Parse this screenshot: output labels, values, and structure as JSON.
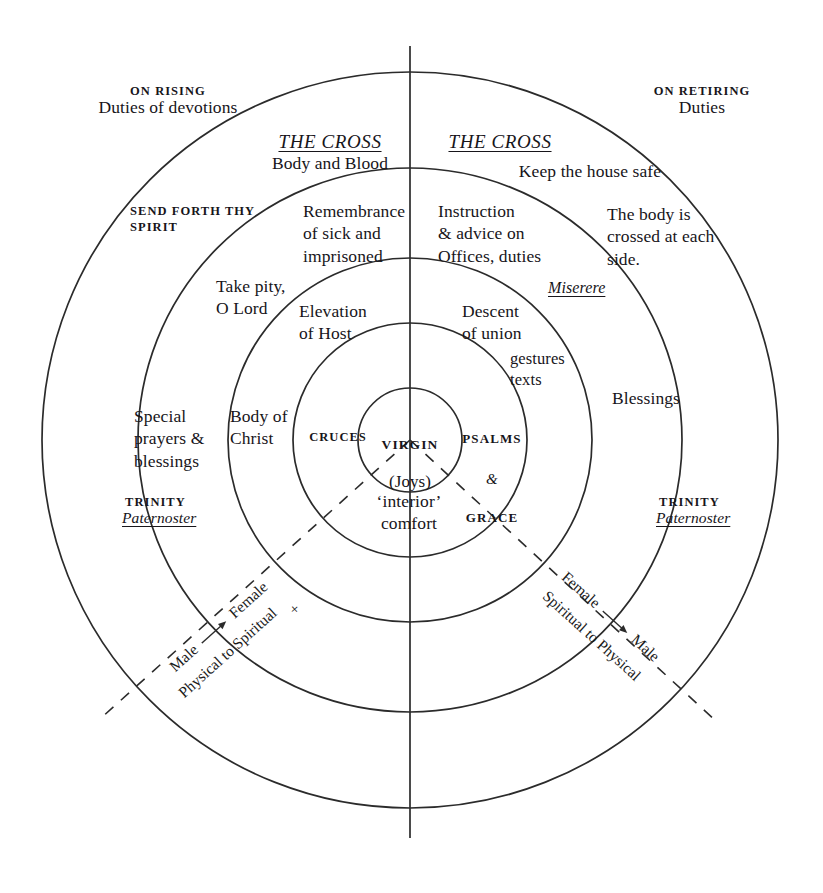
{
  "diagram": {
    "geometry": {
      "center_x": 410,
      "center_y": 440,
      "ring_radii": [
        52,
        117,
        182,
        272,
        368
      ],
      "axis_line_top": 46,
      "axis_line_bottom": 838
    },
    "colors": {
      "stroke": "#2b2b2b",
      "text": "#17151a",
      "background": "#ffffff"
    },
    "outer_labels": {
      "left_heading": "ON RISING",
      "left_sub": "Duties of devotions",
      "right_heading": "ON RETIRING",
      "right_sub": "Duties"
    },
    "cross_headings": {
      "left_title": "THE CROSS",
      "left_sub": "Body and Blood",
      "right_title": "THE CROSS",
      "right_sub": "Keep the house safe"
    },
    "ring_labels": {
      "send_forth": "SEND FORTH THY\nSPIRIT",
      "body_crossed": "The body is\ncrossed at each\nside.",
      "remembrance": "Remembrance\nof sick and\nimprisoned",
      "instruction": "Instruction\n& advice on\nOffices, duties",
      "take_pity": "Take pity,\nO Lord",
      "miserere": "Miserere",
      "elevation": "Elevation\nof Host",
      "descent": "Descent\nof union",
      "gestures": "gestures\ntexts",
      "special_prayers": "Special\nprayers &\nblessings",
      "body_of_christ": "Body of\nChrist",
      "blessings": "Blessings",
      "cruces": "CRUCES",
      "psalms_line1": "PSALMS",
      "psalms_amp": "&",
      "psalms_line3": "GRACE",
      "virgin": "VIRGIN",
      "joys": "(Joys)",
      "interior_comfort": "‘interior’\ncomfort",
      "trinity_left": "TRINITY",
      "paternoster_left": "Paternoster",
      "trinity_right": "TRINITY",
      "paternoster_right": "Paternoster"
    },
    "axes": {
      "left": {
        "from": "Male",
        "to": "Female",
        "plus": "+",
        "direction_text": "Physical to Spiritual"
      },
      "right": {
        "from": "Female",
        "to": "Male",
        "direction_text": "Spiritual to Physical"
      }
    }
  }
}
